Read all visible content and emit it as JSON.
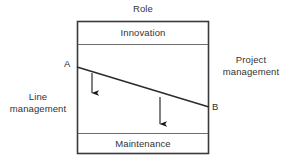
{
  "diagram": {
    "title": "Role",
    "bands": [
      {
        "id": "innovation",
        "label": "Innovation"
      },
      {
        "id": "middle",
        "label": ""
      },
      {
        "id": "maintenance",
        "label": "Maintenance"
      }
    ],
    "side_labels": {
      "left": "Line\nmanagement",
      "right": "Project\nmanagement"
    },
    "points": {
      "start": "A",
      "end": "B"
    },
    "colors": {
      "border": "#3a3a3a",
      "divider": "#6e6e6e",
      "trend_line": "#2b2b2b",
      "arrow": "#1a1a1a",
      "background": "#ffffff",
      "text": "#333333"
    },
    "geometry": {
      "box": {
        "x": 77,
        "y": 21,
        "width": 132,
        "height": 133
      },
      "divider_y": [
        44,
        133
      ],
      "trend": {
        "x1": 77,
        "y1": 67,
        "x2": 209,
        "y2": 107
      },
      "arrows": [
        {
          "x": 92,
          "y1": 73,
          "y2": 101
        },
        {
          "x": 160,
          "y1": 97,
          "y2": 132
        }
      ]
    }
  }
}
